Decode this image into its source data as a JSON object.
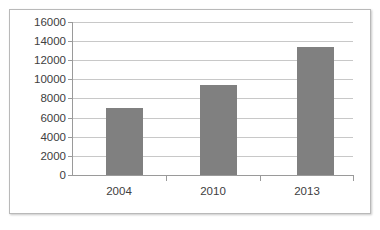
{
  "chart_data": {
    "type": "bar",
    "title": "",
    "subtitle": "",
    "xlabel": "",
    "ylabel": "",
    "categories": [
      "2004",
      "2010",
      "2013"
    ],
    "values": [
      7000,
      9400,
      13400
    ],
    "series": [
      {
        "name": "Series 1",
        "values": [
          7000,
          9400,
          13400
        ]
      }
    ],
    "ylim": [
      0,
      16000
    ],
    "y_tick_step": 2000,
    "y_ticks": [
      0,
      2000,
      4000,
      6000,
      8000,
      10000,
      12000,
      14000,
      16000
    ],
    "y_tick_labels": [
      "0",
      "2000",
      "4000",
      "6000",
      "8000",
      "10000",
      "12000",
      "14000",
      "16000"
    ],
    "grid": true,
    "grid_axis": "y",
    "legend": false,
    "legend_position": "none",
    "bar_color": "#808080",
    "gridline_color": "#c8c8c8",
    "axis_color": "#9a9a9a",
    "text_color": "#404040",
    "plot_background": "#ffffff",
    "frame_border_color": "#b9b9b9"
  }
}
